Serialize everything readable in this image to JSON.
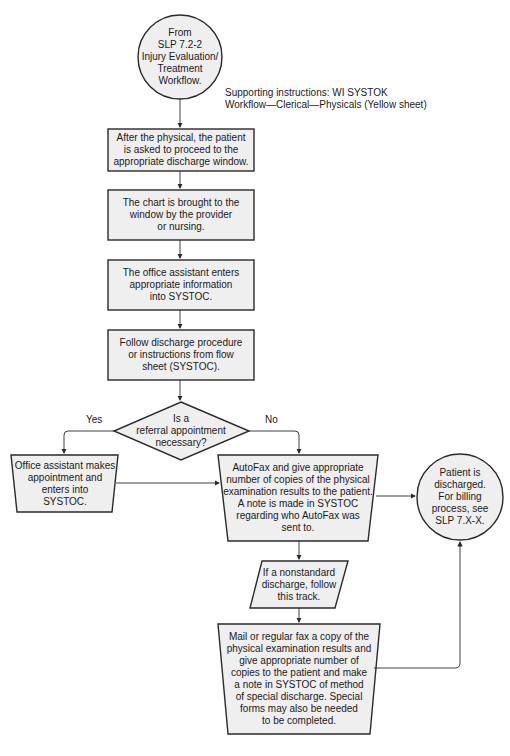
{
  "colors": {
    "fill": "#efefef",
    "stroke": "#2a2a2a",
    "text": "#1a1a1a"
  },
  "start": {
    "text": "From\nSLP 7.2-2\nInjury Evaluation/\nTreatment\nWorkflow."
  },
  "supporting_note": {
    "text": "Supporting instructions: WI SYSTOK\nWorkflow—Clerical—Physicals (Yellow sheet)"
  },
  "steps": [
    {
      "text": "After the physical, the patient\nis asked to proceed to the\nappropriate discharge window."
    },
    {
      "text": "The chart is brought to the\nwindow by the provider\nor nursing."
    },
    {
      "text": "The office assistant enters\nappropriate information\ninto SYSTOC."
    },
    {
      "text": "Follow discharge procedure\nor instructions from flow\nsheet (SYSTOC)."
    }
  ],
  "decision": {
    "text": "Is a\nreferral appointment\nnecessary?",
    "yes_label": "Yes",
    "no_label": "No"
  },
  "yes_branch": {
    "text": "Office assistant makes\nappointment and\nenters into\nSYSTOC."
  },
  "no_branch": {
    "text": "AutoFax and give appropriate\nnumber of copies of the physical\nexamination results to the patient.\nA note is made in SYSTOC\nregarding who AutoFax was\nsent to."
  },
  "nonstandard": {
    "text": "If a nonstandard\ndischarge, follow\nthis track."
  },
  "special": {
    "text": "Mail or regular fax a copy of the\nphysical examination results and\ngive appropriate number of\ncopies to the patient and make\na note in SYSTOC of method\nof special discharge. Special\nforms may also be needed\nto be completed."
  },
  "end": {
    "text": "Patient is\ndischarged.\nFor billing\nprocess, see\nSLP 7.X-X."
  }
}
